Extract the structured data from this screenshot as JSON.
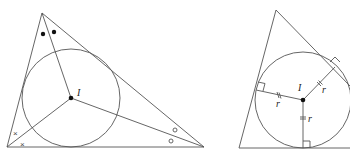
{
  "figures": [
    {
      "id": "angle-bisectors-incircle",
      "incenter_label": "I",
      "angle_marks": {
        "top_vertex": "dots",
        "left_vertex": "crosses",
        "right_vertex": "circles"
      }
    },
    {
      "id": "incircle-radii",
      "incenter_label": "I",
      "radius_labels": [
        "r",
        "r",
        "r"
      ]
    }
  ],
  "colors": {
    "line": "#555555",
    "point": "#111111"
  }
}
